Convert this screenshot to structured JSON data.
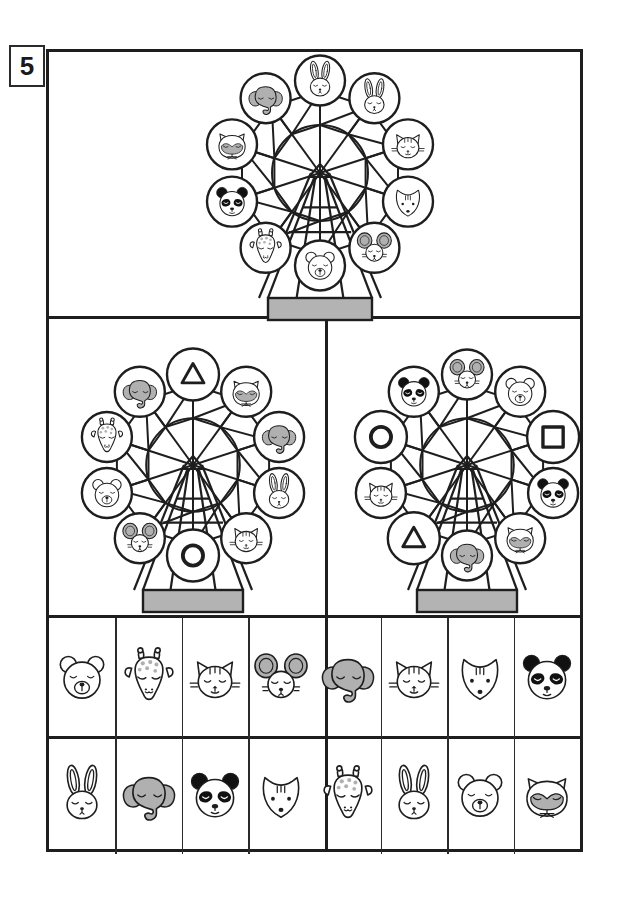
{
  "worksheet": {
    "exercise_number": "5",
    "type": "match-the-animals-ferris-wheel",
    "colors": {
      "ink": "#1e1e1e",
      "gray_fill": "#b0b0b0",
      "base_gray": "#b3b3b3",
      "panda_black": "#111111",
      "paper": "#ffffff"
    }
  },
  "panels": {
    "top": {
      "name": "reference-ferris-wheel",
      "cabin_count": 10,
      "cabins": [
        {
          "position": "top",
          "angle": -90,
          "animal": "rabbit"
        },
        {
          "position": "upper-left",
          "angle": -126,
          "animal": "elephant"
        },
        {
          "position": "left-upper",
          "angle": -162,
          "animal": "raccoon"
        },
        {
          "position": "left",
          "angle": 162,
          "animal": "panda"
        },
        {
          "position": "lower-left",
          "angle": 126,
          "animal": "giraffe"
        },
        {
          "position": "bottom",
          "angle": 90,
          "animal": "bear"
        },
        {
          "position": "lower-right",
          "angle": 54,
          "animal": "mouse"
        },
        {
          "position": "right",
          "angle": 18,
          "animal": "fox"
        },
        {
          "position": "right-upper",
          "angle": -18,
          "animal": "cat"
        },
        {
          "position": "upper-right",
          "angle": -54,
          "animal": "rabbit"
        }
      ],
      "cabins_clockwise_from_top": [
        "elephant",
        "rabbit",
        "cat",
        "fox",
        "mouse",
        "bear",
        "giraffe",
        "panda",
        "raccoon"
      ]
    },
    "left": {
      "name": "left-puzzle-ferris-wheel",
      "cabin_count": 10,
      "cabins_clockwise_from_top": [
        "triangle",
        "raccoon",
        "elephant",
        "rabbit",
        "cat",
        "circle",
        "mouse",
        "bear",
        "giraffe"
      ],
      "missing_shapes": [
        "triangle",
        "circle"
      ]
    },
    "right": {
      "name": "right-puzzle-ferris-wheel",
      "cabin_count": 10,
      "cabins_clockwise_from_top": [
        "mouse",
        "bear",
        "square",
        "panda",
        "raccoon",
        "elephant",
        "triangle",
        "cat",
        "circle"
      ],
      "missing_shapes": [
        "circle",
        "square",
        "triangle"
      ]
    }
  },
  "sticker_grid": {
    "columns": 8,
    "rows": 2,
    "cells": [
      [
        {
          "animal": "bear"
        },
        {
          "animal": "giraffe"
        },
        {
          "animal": "cat"
        },
        {
          "animal": "mouse"
        },
        {
          "animal": "elephant"
        },
        {
          "animal": "cat"
        },
        {
          "animal": "fox"
        },
        {
          "animal": "panda"
        }
      ],
      [
        {
          "animal": "rabbit"
        },
        {
          "animal": "elephant"
        },
        {
          "animal": "panda"
        },
        {
          "animal": "fox"
        },
        {
          "animal": "giraffe"
        },
        {
          "animal": "rabbit"
        },
        {
          "animal": "bear"
        },
        {
          "animal": "raccoon"
        }
      ]
    ]
  },
  "animal_names": {
    "bear": "bear",
    "giraffe": "giraffe",
    "cat": "cat",
    "mouse": "mouse",
    "elephant": "elephant",
    "fox": "fox",
    "panda": "panda",
    "rabbit": "rabbit",
    "raccoon": "raccoon",
    "circle": "circle",
    "triangle": "triangle",
    "square": "square"
  }
}
